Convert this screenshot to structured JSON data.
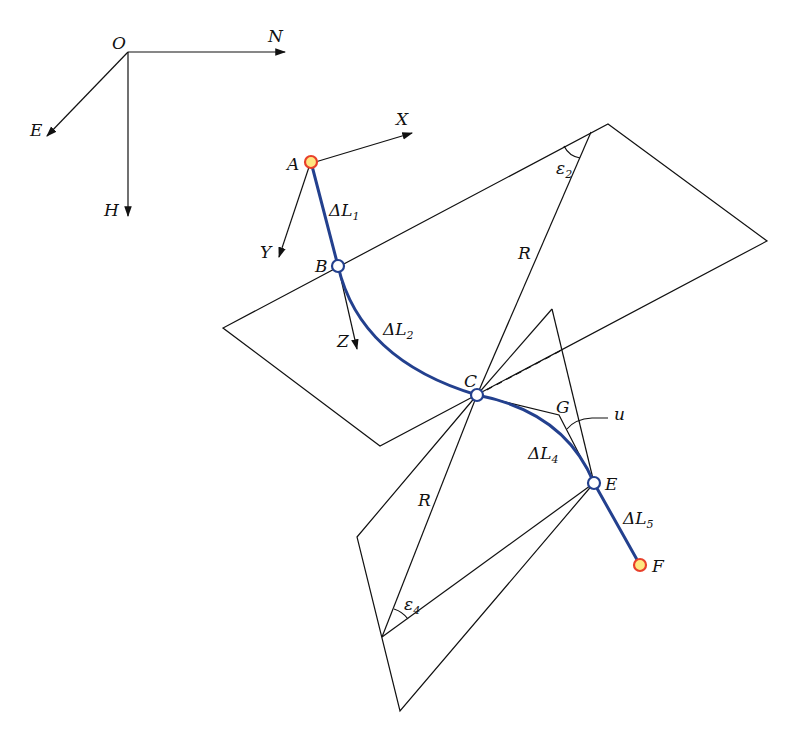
{
  "figure": {
    "type": "wellbore trajectory diagram",
    "colors": {
      "trajectory": "#23408e",
      "endpoint_fill": "#ffe680",
      "endpoint_stroke": "#e8402a",
      "node_fill": "#ffffff",
      "node_stroke": "#23408e",
      "lines": "#111111"
    },
    "global_axes": {
      "origin": "O",
      "axes": [
        "N",
        "E",
        "H"
      ]
    },
    "local_axes": {
      "axes": [
        "X",
        "Y",
        "Z"
      ]
    },
    "points": {
      "A": "A",
      "B": "B",
      "C": "C",
      "E": "E",
      "F": "F",
      "G": "G"
    },
    "segments": {
      "dL1": {
        "delta": "Δ",
        "L": "L",
        "sub": "1"
      },
      "dL2": {
        "delta": "Δ",
        "L": "L",
        "sub": "2"
      },
      "dL4": {
        "delta": "Δ",
        "L": "L",
        "sub": "4"
      },
      "dL5": {
        "delta": "Δ",
        "L": "L",
        "sub": "5"
      }
    },
    "radius_label_upper": "R",
    "radius_label_lower": "R",
    "angles": {
      "eps2": {
        "sym": "ε",
        "sub": "2"
      },
      "eps4": {
        "sym": "ε",
        "sub": "4"
      },
      "u": "u"
    }
  }
}
